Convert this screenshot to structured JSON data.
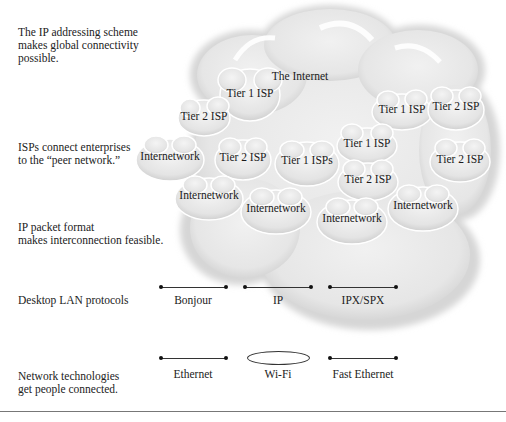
{
  "descriptions": {
    "addressing": [
      "The IP addressing scheme",
      "makes global connectivity",
      "possible."
    ],
    "isps": [
      "ISPs connect enterprises",
      "to the “peer network.”"
    ],
    "packet": [
      "IP packet format",
      "makes interconnection feasible."
    ],
    "lan_protocols": "Desktop LAN protocols",
    "technologies": [
      "Network technologies",
      "get people connected."
    ]
  },
  "internet_cloud": {
    "label": "The Internet",
    "fill_color": "#ececec",
    "sub_clouds": [
      {
        "label": "Tier 1 ISP",
        "x": 250,
        "y": 93
      },
      {
        "label": "Tier 2 ISP",
        "x": 204,
        "y": 116
      },
      {
        "label": "Tier 1 ISP",
        "x": 402,
        "y": 109
      },
      {
        "label": "Tier 2 ISP",
        "x": 456,
        "y": 106
      },
      {
        "label": "Internetwork",
        "x": 170,
        "y": 156
      },
      {
        "label": "Tier 2 ISP",
        "x": 243,
        "y": 157
      },
      {
        "label": "Tier 1 ISPs",
        "x": 307,
        "y": 160
      },
      {
        "label": "Tier 1 ISP",
        "x": 367,
        "y": 143
      },
      {
        "label": "Tier 2 ISP",
        "x": 460,
        "y": 159
      },
      {
        "label": "Tier 2 ISP",
        "x": 368,
        "y": 179
      },
      {
        "label": "Internetwork",
        "x": 209,
        "y": 195
      },
      {
        "label": "Internetwork",
        "x": 276,
        "y": 208
      },
      {
        "label": "Internetwork",
        "x": 352,
        "y": 218
      },
      {
        "label": "Internetwork",
        "x": 423,
        "y": 205
      }
    ]
  },
  "protocols": [
    {
      "label": "Bonjour",
      "type": "line"
    },
    {
      "label": "IP",
      "type": "line"
    },
    {
      "label": "IPX/SPX",
      "type": "line"
    }
  ],
  "technologies": [
    {
      "label": "Ethernet",
      "type": "line"
    },
    {
      "label": "Wi-Fi",
      "type": "ellipse"
    },
    {
      "label": "Fast Ethernet",
      "type": "line"
    }
  ]
}
